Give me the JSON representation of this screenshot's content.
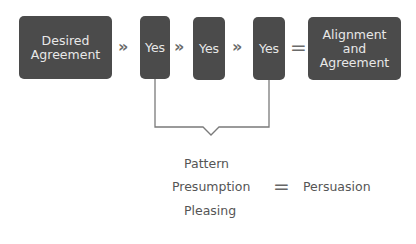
{
  "flow": {
    "start_box": {
      "line1": "Desired",
      "line2": "Agreement"
    },
    "yes_boxes": [
      "Yes",
      "Yes",
      "Yes"
    ],
    "separator": "»",
    "equals": "=",
    "result_box": {
      "line1": "Alignment",
      "line2": "and",
      "line3": "Agreement"
    }
  },
  "equation": {
    "terms": [
      "Pattern",
      "Presumption",
      "Pleasing"
    ],
    "equals": "=",
    "result": "Persuasion"
  },
  "colors": {
    "box_fill": "#4b4b4b",
    "box_text": "#e8e8e8",
    "connector": "#7a7a7a",
    "text": "#555555"
  }
}
